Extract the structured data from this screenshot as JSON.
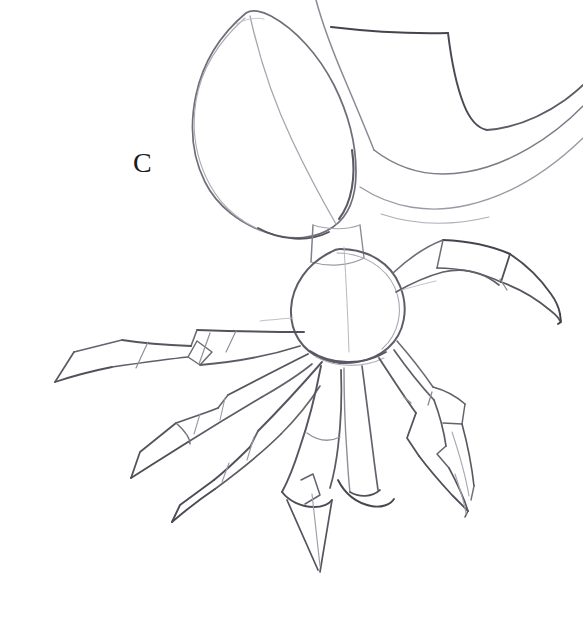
{
  "canvas": {
    "width": 583,
    "height": 627,
    "background_color": "#ffffff",
    "medium": "pencil-sketch",
    "title": "Pencil construction sketch of a creature labelled C"
  },
  "label": {
    "text": "C",
    "x": 133,
    "y": 148,
    "font_size_px": 28,
    "color": "#1a1a1a"
  },
  "palette": {
    "ink_dark": "#3a3a42",
    "ink_mid": "#6b6b76",
    "ink_light": "#9b9ba6",
    "ink_faint": "#c2c2cc",
    "paper": "#ffffff"
  },
  "drawing": {
    "subject": "insect-like creature with leaf-shaped head, angular fin and eight radiating segmented legs",
    "parts": [
      {
        "name": "leaf-head",
        "description": "large pointed oval leaf shape tilted upper-left with interior midrib line"
      },
      {
        "name": "angular-fin",
        "description": "curved angular fin/wing shape at upper right running off the right edge"
      },
      {
        "name": "neck",
        "description": "short rectangular segment joining head to body"
      },
      {
        "name": "body",
        "description": "egg shaped central thorax"
      },
      {
        "name": "leg-upper-right",
        "description": "boxy upper segment with curved lower edge ending in a hooked claw"
      },
      {
        "name": "leg-mid-left-upper",
        "description": "long angular leg reaching to the far left with pointed tip"
      },
      {
        "name": "leg-mid-left-lower",
        "description": "angular leg below with diamond joint and pointed tip"
      },
      {
        "name": "leg-lower-left",
        "description": "downward angular leg with flattened foot and pointed claw"
      },
      {
        "name": "leg-center-lower",
        "description": "long downward leg ending in a narrow spike near the bottom"
      },
      {
        "name": "leg-lower-right",
        "description": "downward right leg with a bent knee and pointed claw"
      },
      {
        "name": "leg-far-right",
        "description": "outer right leg with hooked claw tip"
      }
    ]
  }
}
